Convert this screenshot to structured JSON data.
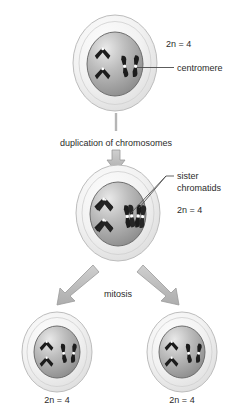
{
  "diagram": {
    "background_color": "#ffffff"
  },
  "colors": {
    "cytoplasm_light": "#f2f2f2",
    "cytoplasm_edge": "#bdbdbd",
    "nucleus_light": "#e3e3e3",
    "nucleus_dark": "#8f8f8f",
    "nucleus_edge": "#6e6e6e",
    "chromosome": "#1c1c1c",
    "centromere": "#ffffff",
    "arrow": "#b5b5b5",
    "arrow_edge": "#9a9a9a",
    "leader_line": "#4a4a4a",
    "text": "#2b2b2b"
  },
  "stages": {
    "parent_cell": {
      "name": "parent-cell",
      "ploidy_label": "2n = 4",
      "chromosome_count": 4,
      "chromosomes": [
        {
          "shape": "v-shaped",
          "centromere": true
        },
        {
          "shape": "v-shaped",
          "centromere": true
        },
        {
          "shape": "rod",
          "centromere": true
        },
        {
          "shape": "rod",
          "centromere": true
        }
      ]
    },
    "duplicated_cell": {
      "name": "duplicated-cell",
      "ploidy_label": "2n = 4",
      "chromosome_count": 4,
      "chromosomes": [
        {
          "shape": "v-shaped-duplicated",
          "centromere": true
        },
        {
          "shape": "v-shaped-duplicated",
          "centromere": true
        },
        {
          "shape": "rod-duplicated",
          "centromere": true
        },
        {
          "shape": "rod-duplicated",
          "centromere": true
        }
      ]
    },
    "daughter_cell_left": {
      "name": "daughter-cell-left",
      "ploidy_label": "2n = 4",
      "chromosome_count": 4
    },
    "daughter_cell_right": {
      "name": "daughter-cell-right",
      "ploidy_label": "2n = 4",
      "chromosome_count": 4
    }
  },
  "annotations": {
    "centromere": "centromere",
    "sister_chromatids_line1": "sister",
    "sister_chromatids_line2": "chromatids",
    "duplication_step": "duplication of chromosomes",
    "mitosis_step": "mitosis"
  },
  "icons": {
    "arrow_down": "arrow-down-icon",
    "arrow_diagonal_left": "arrow-diagonal-down-left-icon",
    "arrow_diagonal_right": "arrow-diagonal-down-right-icon"
  }
}
